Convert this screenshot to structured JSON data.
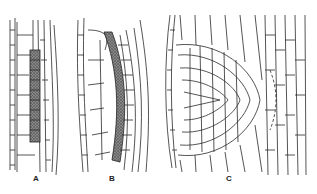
{
  "figure": {
    "panels": [
      {
        "label": "A",
        "x": 33,
        "y": 174
      },
      {
        "label": "B",
        "x": 109,
        "y": 174
      },
      {
        "label": "C",
        "x": 226,
        "y": 174
      }
    ],
    "colors": {
      "ink": "#2a2a2a",
      "paper": "#ffffff",
      "stipple": "#6a6a6a"
    }
  }
}
